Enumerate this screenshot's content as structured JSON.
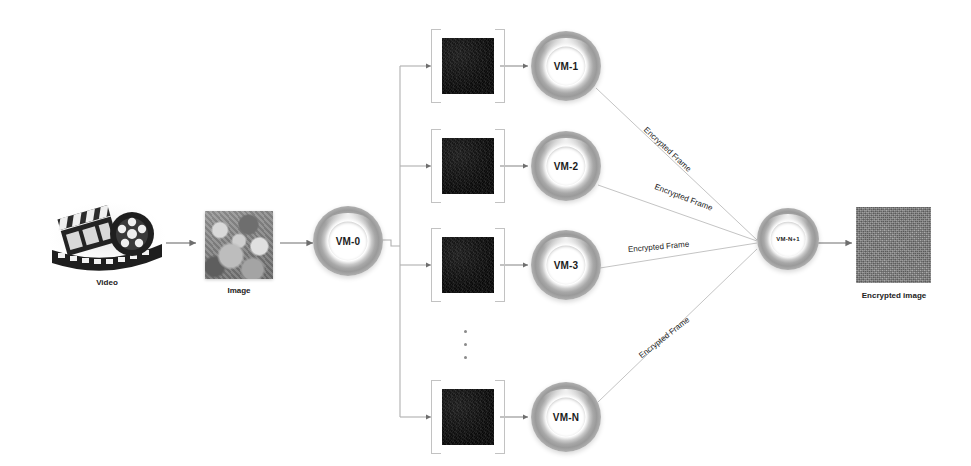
{
  "diagram": {
    "background_color": "#ffffff",
    "wire_color": "#b0b0b0",
    "arrow_color": "#6e6e6e"
  },
  "source": {
    "video": {
      "icon": "film-reel-clapperboard-icon",
      "caption": "Video"
    },
    "image": {
      "icon": "grayscale-photo-thumbnail",
      "caption": "Image"
    }
  },
  "dispatcher": {
    "label": "VM-0",
    "icon": "vm-donut-icon"
  },
  "workers": [
    {
      "id": "vm-1",
      "label": "VM-1",
      "frame_icon": "dark-video-frame",
      "edge_label": "Encrypted Frame"
    },
    {
      "id": "vm-2",
      "label": "VM-2",
      "frame_icon": "dark-video-frame",
      "edge_label": "Encrypted Frame"
    },
    {
      "id": "vm-3",
      "label": "VM-3",
      "frame_icon": "dark-video-frame",
      "edge_label": "Encrypted Frame"
    },
    {
      "id": "vm-n",
      "label": "VM-N",
      "frame_icon": "dark-video-frame",
      "edge_label": "Encrypted Frame"
    }
  ],
  "ellipsis": "⋮",
  "aggregator": {
    "label": "VM-N+1",
    "icon": "vm-donut-icon"
  },
  "output": {
    "icon": "gray-noise-thumbnail",
    "caption": "Encrypted image"
  }
}
